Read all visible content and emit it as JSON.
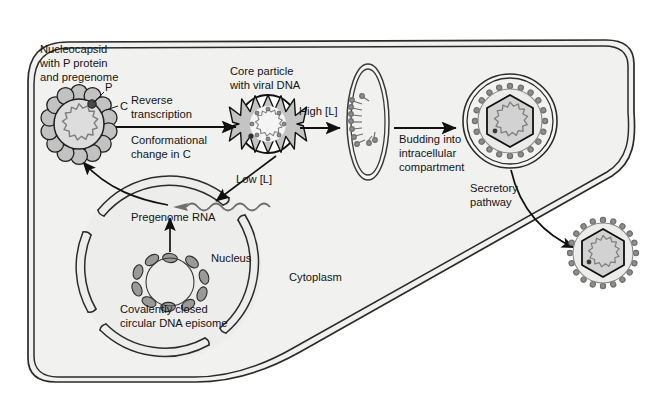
{
  "figure": {
    "kind": "cell-biology-pathway-diagram"
  },
  "colors": {
    "outside_background": "#ffffff",
    "cytoplasm_fill": "#f1f1ef",
    "nucleus_fill": "#ededeb",
    "membrane_stroke": "#2b2b2b",
    "capsid_fill": "#c9c9c9",
    "capsid_stroke": "#1a1a1a",
    "core_fill": "#b9b9b9",
    "text": "#141414",
    "arrow": "#111111",
    "spike_fill": "#8f8f8f",
    "dna_fill": "#909090",
    "lumen_fill": "#dedede"
  },
  "compartments": {
    "cytoplasm_label": "Cytoplasm",
    "nucleus_label": "Nucleus"
  },
  "labels": {
    "nucleocapsid": {
      "line1": "Nucleocapsid",
      "line2": "with P protein",
      "line3": "and pregenome"
    },
    "core_particle": {
      "line1": "Core particle",
      "line2": "with viral DNA"
    },
    "p_protein": "P",
    "c_protein": "C",
    "pregenome_rna": "Pregenome RNA",
    "episome": {
      "line1": "Covalently closed",
      "line2": "circular DNA episome"
    }
  },
  "arrows": {
    "reverse_transcription": {
      "line1": "Reverse",
      "line2": "transcription"
    },
    "conformational_change": {
      "line1": "Conformational",
      "line2": "change in C"
    },
    "high_l": "High [L]",
    "low_l": "Low [L]",
    "budding": {
      "line1": "Budding into",
      "line2": "intracellular",
      "line3": "compartment"
    },
    "secretory_pathway": {
      "line1": "Secretory",
      "line2": "pathway"
    }
  },
  "particles": {
    "nucleocapsid": {
      "name": "nucleocapsid-particle",
      "cx": 79,
      "cy": 124,
      "r": 31,
      "subunits": 14
    },
    "core_particle": {
      "name": "core-particle",
      "cx": 268,
      "cy": 124,
      "r": 29,
      "spikes": 14
    },
    "compartment_membrane": {
      "name": "intracellular-compartment",
      "cx": 368,
      "cy": 120,
      "rx": 22,
      "ry": 58
    },
    "budded_virion": {
      "name": "budded-virion-in-compartment",
      "cx": 510,
      "cy": 120,
      "r": 48
    },
    "released_virion": {
      "name": "released-virion",
      "cx": 603,
      "cy": 253,
      "r": 42
    }
  }
}
